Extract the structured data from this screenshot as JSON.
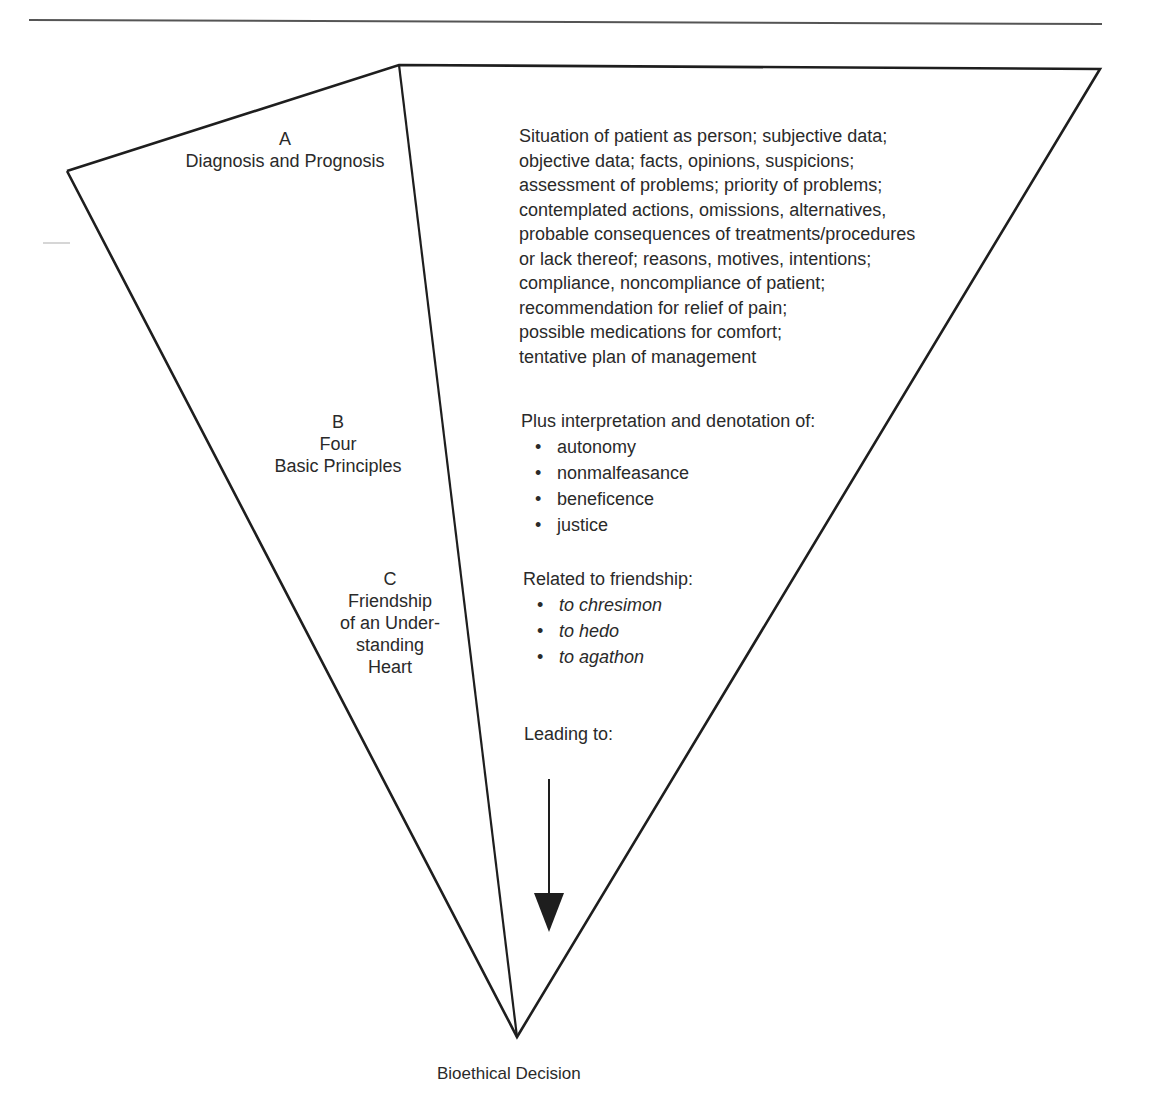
{
  "diagram": {
    "type": "inverted-triangle-flow",
    "sections": {
      "a": {
        "letter": "A",
        "title_lines": [
          "Diagnosis and Prognosis"
        ]
      },
      "b": {
        "letter": "B",
        "title_lines": [
          "Four",
          "Basic Principles"
        ]
      },
      "c": {
        "letter": "C",
        "title_lines": [
          "Friendship",
          "of an Under-",
          "standing",
          "Heart"
        ]
      }
    },
    "details": {
      "a_lines": [
        "Situation of patient as person; subjective data;",
        "objective data; facts, opinions, suspicions;",
        "assessment of problems; priority of problems;",
        "contemplated actions, omissions, alternatives,",
        "probable consequences of treatments/procedures",
        "or lack thereof; reasons, motives, intentions;",
        "compliance, noncompliance of patient;",
        "recommendation for relief of pain;",
        "possible medications for comfort;",
        "tentative plan of management"
      ],
      "b_heading": "Plus interpretation and denotation of:",
      "b_items": [
        "autonomy",
        "nonmalfeasance",
        "beneficence",
        "justice"
      ],
      "c_heading": "Related to friendship:",
      "c_items": [
        "to chresimon",
        "to hedo",
        "to agathon"
      ],
      "leading_to": "Leading to:"
    },
    "outcome": "Bioethical Decision",
    "icons": {
      "arrow": "arrow-down-icon"
    },
    "colors": {
      "line": "#1e1e1e",
      "text": "#2a2a2a",
      "rule": "#555555"
    }
  }
}
